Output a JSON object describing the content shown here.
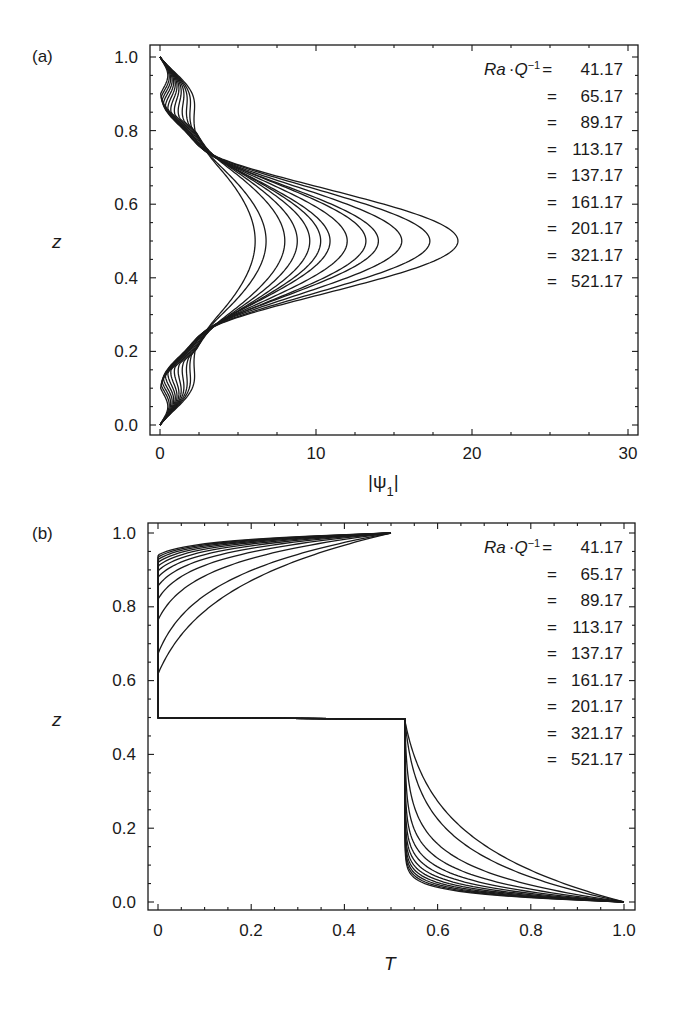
{
  "chart_data": [
    {
      "type": "line",
      "panel": "(a)",
      "title": "",
      "xlabel": "|ψ1|",
      "ylabel": "z",
      "xlim": [
        0,
        30
      ],
      "ylim": [
        0,
        1.0
      ],
      "xticks": [
        "0",
        "10",
        "20",
        "30"
      ],
      "yticks": [
        "0.0",
        "0.2",
        "0.4",
        "0.6",
        "0.8",
        "1.0"
      ],
      "grid": false,
      "legend_position": "upper right",
      "legend_title": "Ra·Q⁻¹",
      "legend": [
        "41.17",
        "65.17",
        "89.17",
        "113.17",
        "137.17",
        "161.17",
        "201.17",
        "321.17",
        "521.17"
      ],
      "description": "Profiles of |ψ1| vs z; zero at z=0 and z=1, curves cross near (3, 0.22) and (3, 0.78), peak at z=0.5",
      "series_peak_values_at_z_0_5": [
        6.1,
        6.8,
        8.0,
        8.8,
        9.6,
        10.3,
        10.9,
        12.0,
        13.2,
        14.0,
        15.5,
        17.3,
        19.1
      ]
    },
    {
      "type": "line",
      "panel": "(b)",
      "title": "",
      "xlabel": "T",
      "ylabel": "z",
      "xlim": [
        0,
        1.0
      ],
      "ylim": [
        0,
        1.0
      ],
      "xticks": [
        "0",
        "0.2",
        "0.4",
        "0.6",
        "0.8",
        "1.0"
      ],
      "yticks": [
        "0.0",
        "0.2",
        "0.4",
        "0.6",
        "0.8",
        "1.0"
      ],
      "grid": false,
      "legend_position": "upper right",
      "legend_title": "Ra·Q⁻¹",
      "legend": [
        "41.17",
        "65.17",
        "89.17",
        "113.17",
        "137.17",
        "161.17",
        "201.17",
        "321.17",
        "521.17"
      ],
      "description": "Temperature profiles T vs z from (0,1) to (1,0); sharp transition through T=0.5 at z=0.5, thin boundary-layer profiles",
      "series_sharpness": [
        6,
        8,
        12,
        16,
        20,
        24,
        28,
        32,
        36,
        40,
        44,
        48
      ]
    }
  ],
  "panel_a": {
    "label": "(a)",
    "ylabel": "z",
    "xlabel_main": "|ψ",
    "xlabel_sub": "1",
    "xlabel_end": "|",
    "xticks": [
      "0",
      "10",
      "20",
      "30"
    ],
    "yticks": [
      "0.0",
      "0.2",
      "0.4",
      "0.6",
      "0.8",
      "1.0"
    ],
    "legend_head": "Ra",
    "legend_dot": "·Q",
    "legend_sup": "−1",
    "legend_eq_first": "=",
    "legend_values": [
      "41.17",
      "65.17",
      "89.17",
      "113.17",
      "137.17",
      "161.17",
      "201.17",
      "321.17",
      "521.17"
    ]
  },
  "panel_b": {
    "label": "(b)",
    "ylabel": "z",
    "xlabel": "T",
    "xticks": [
      "0",
      "0.2",
      "0.4",
      "0.6",
      "0.8",
      "1.0"
    ],
    "yticks": [
      "0.0",
      "0.2",
      "0.4",
      "0.6",
      "0.8",
      "1.0"
    ],
    "legend_head": "Ra",
    "legend_dot": "·Q",
    "legend_sup": "−1",
    "legend_eq_first": "=",
    "legend_values": [
      "41.17",
      "65.17",
      "89.17",
      "113.17",
      "137.17",
      "161.17",
      "201.17",
      "321.17",
      "521.17"
    ]
  },
  "colors": {
    "ink": "#1a1a1a",
    "background": "#ffffff"
  }
}
